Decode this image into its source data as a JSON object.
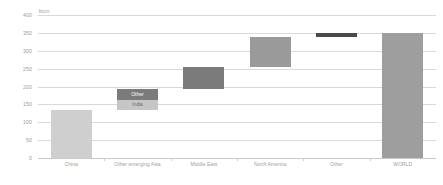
{
  "chart_data": {
    "type": "bar",
    "chart_variant": "waterfall-stacked",
    "title": "",
    "subtitle": "",
    "xlabel": "",
    "ylabel": "bcm",
    "unit": "bcm",
    "ylim": [
      0,
      400
    ],
    "ytick_values": [
      0,
      50,
      100,
      150,
      200,
      250,
      300,
      350,
      400
    ],
    "ytick_labels": [
      "0",
      "50",
      "100",
      "150",
      "200",
      "250",
      "300",
      "350",
      "400"
    ],
    "grid": true,
    "legend_position": "none",
    "categories": [
      "China",
      "Other emerging Asia",
      "Middle East",
      "North America",
      "Other",
      "WORLD"
    ],
    "values": [
      135,
      58,
      62,
      83,
      12,
      350
    ],
    "bars": [
      {
        "category": "China",
        "kind": "increment",
        "base": 0,
        "total": 135,
        "segments": [
          {
            "label": "",
            "value": 135,
            "base": 0,
            "top": 135,
            "color": "#cfcfcf",
            "style": "light"
          }
        ]
      },
      {
        "category": "Other emerging Asia",
        "kind": "increment",
        "base": 135,
        "total": 58,
        "segments": [
          {
            "label": "India",
            "value": 28,
            "base": 135,
            "top": 163,
            "color": "#c6c6c6",
            "style": "light"
          },
          {
            "label": "Other",
            "value": 30,
            "base": 163,
            "top": 193,
            "color": "#7b7b7b",
            "style": "dark"
          }
        ]
      },
      {
        "category": "Middle East",
        "kind": "increment",
        "base": 193,
        "total": 62,
        "segments": [
          {
            "label": "",
            "value": 62,
            "base": 193,
            "top": 255,
            "color": "#7b7b7b",
            "style": "dark"
          }
        ]
      },
      {
        "category": "North America",
        "kind": "increment",
        "base": 255,
        "total": 83,
        "segments": [
          {
            "label": "",
            "value": 83,
            "base": 255,
            "top": 338,
            "color": "#9a9a9a",
            "style": "dark"
          }
        ]
      },
      {
        "category": "Other",
        "kind": "increment",
        "base": 338,
        "total": 12,
        "segments": [
          {
            "label": "",
            "value": 12,
            "base": 338,
            "top": 350,
            "color": "#4a4a4a",
            "style": "dark"
          }
        ]
      },
      {
        "category": "WORLD",
        "kind": "total",
        "base": 0,
        "total": 350,
        "segments": [
          {
            "label": "",
            "value": 350,
            "base": 0,
            "top": 350,
            "color": "#9e9e9e",
            "style": "dark"
          }
        ]
      }
    ],
    "annotations": [
      {
        "text": "Other",
        "category": "Other emerging Asia",
        "on": "dark-segment"
      },
      {
        "text": "India",
        "category": "Other emerging Asia",
        "on": "light-segment"
      }
    ],
    "colors": {
      "increment_dark": "#7b7b7b",
      "increment_light": "#c6c6c6",
      "china": "#cfcfcf",
      "north_america": "#9a9a9a",
      "other_thin": "#4a4a4a",
      "world_total": "#9e9e9e",
      "gridline": "#d9d9d9",
      "tick_text": "#9b9b9b"
    }
  }
}
